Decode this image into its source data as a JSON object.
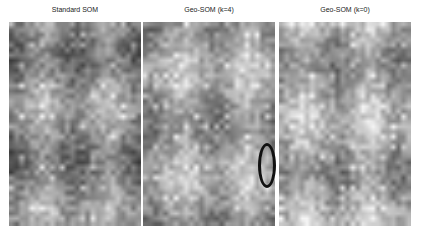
{
  "figure": {
    "panels": [
      {
        "title": "Standard SOM",
        "left": 9,
        "seed": 11,
        "base": 140
      },
      {
        "title": "Geo-SOM (k=4)",
        "left": 143,
        "seed": 23,
        "base": 160
      },
      {
        "title": "Geo-SOM (k=0)",
        "left": 279,
        "seed": 37,
        "base": 165
      }
    ],
    "annotation": {
      "type": "ellipse",
      "panel": 1,
      "x": 258,
      "y": 143,
      "w": 18,
      "h": 45,
      "color": "#111111"
    },
    "grid": {
      "cols": 26,
      "rows": 40
    }
  }
}
